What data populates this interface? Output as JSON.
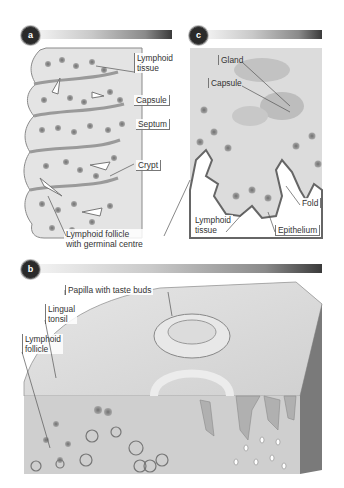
{
  "panels": {
    "a": {
      "badge": "a",
      "labels": {
        "lymphoid_tissue": [
          "Lymphoid",
          "tissue"
        ],
        "capsule": "Capsule",
        "septum": "Septum",
        "crypt": "Crypt",
        "lymphoid_follicle": [
          "Lymphoid follicle",
          "with germinal centre"
        ]
      }
    },
    "c": {
      "badge": "c",
      "labels": {
        "gland": "Gland",
        "capsule": "Capsule",
        "fold": "Fold",
        "lymphoid_tissue": [
          "Lymphoid",
          "tissue"
        ],
        "epithelium": "Epithelium"
      }
    },
    "b": {
      "badge": "b",
      "labels": {
        "papilla": "Papilla with taste buds",
        "lingual_tonsil": [
          "Lingual",
          "tonsil"
        ],
        "lymphoid_follicle": [
          "Lymphoid",
          "follicle"
        ]
      }
    }
  },
  "colors": {
    "tissue_light": "#e2e2e2",
    "tissue_mid": "#c4c4c4",
    "nucleus": "#8c8c8c",
    "dark_side": "#7a7a7a",
    "badge": "#2a2a2a"
  }
}
